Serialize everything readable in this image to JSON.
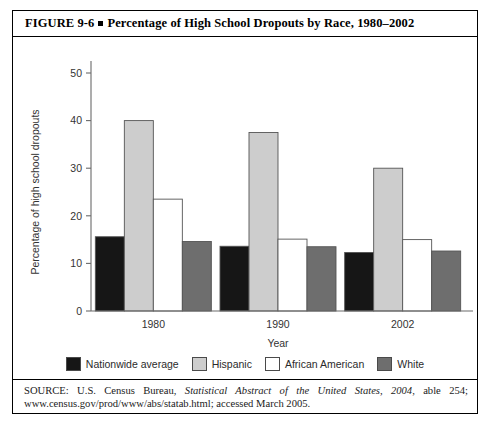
{
  "figure": {
    "label": "FIGURE 9-6",
    "title": "Percentage of High School Dropouts by Race, 1980–2002"
  },
  "source": {
    "prefix": "SOURCE: U.S. Census Bureau, ",
    "italic": "Statistical Abstract of the United States, 2004",
    "suffix": ", able 254; www.census.gov/prod/www/abs/statab.html; accessed March 2005."
  },
  "legend": {
    "position": "bottom",
    "items": [
      {
        "label": "Nationwide average",
        "color": "#161616"
      },
      {
        "label": "Hispanic",
        "color": "#cdcdcd"
      },
      {
        "label": "African American",
        "color": "#ffffff"
      },
      {
        "label": "White",
        "color": "#6e6e6e"
      }
    ]
  },
  "chart_data": {
    "type": "bar",
    "title": "Percentage of High School Dropouts by Race, 1980–2002",
    "xlabel": "Year",
    "ylabel": "Percentage of high school dropouts",
    "categories": [
      "1980",
      "1990",
      "2002"
    ],
    "ylim": [
      0,
      50
    ],
    "yticks": [
      0,
      10,
      20,
      30,
      40,
      50
    ],
    "grid": false,
    "legend_position": "bottom",
    "series": [
      {
        "name": "Nationwide average",
        "color": "#161616",
        "values": [
          15.6,
          13.6,
          12.3
        ]
      },
      {
        "name": "Hispanic",
        "color": "#cdcdcd",
        "values": [
          40.0,
          37.5,
          30.0
        ]
      },
      {
        "name": "African American",
        "color": "#ffffff",
        "values": [
          23.5,
          15.1,
          15.0
        ]
      },
      {
        "name": "White",
        "color": "#6e6e6e",
        "values": [
          14.6,
          13.5,
          12.6
        ]
      }
    ]
  }
}
